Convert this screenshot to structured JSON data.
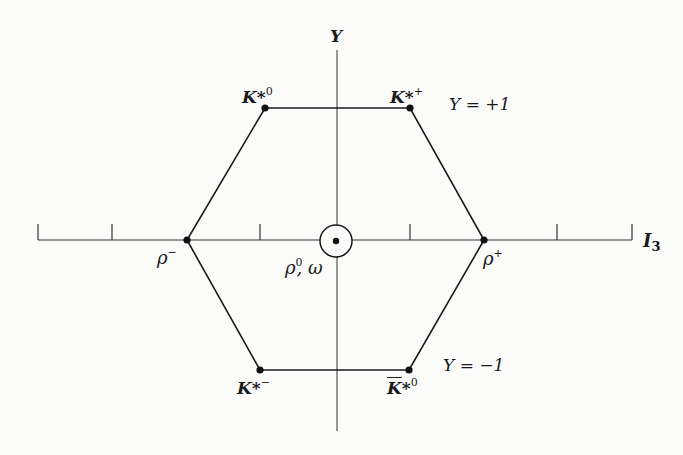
{
  "diagram": {
    "type": "weight-diagram",
    "axes": {
      "x": {
        "label": "I",
        "label_sub": "3",
        "ticks": 9
      },
      "y": {
        "label": "Y"
      }
    },
    "rows": [
      {
        "label": "Y = +1"
      },
      {
        "label": "Y = −1"
      }
    ],
    "particles": [
      {
        "id": "k-star-0",
        "base": "K",
        "star": "*",
        "sup": "0",
        "bar": false
      },
      {
        "id": "k-star-plus",
        "base": "K",
        "star": "*",
        "sup": "+",
        "bar": false
      },
      {
        "id": "rho-minus",
        "base": "ρ",
        "sup": "−"
      },
      {
        "id": "rho-plus",
        "base": "ρ",
        "sup": "+"
      },
      {
        "id": "rho-0-omega",
        "base": "ρ",
        "sup": "0",
        "suffix": ", ω"
      },
      {
        "id": "k-star-minus",
        "base": "K",
        "star": "*",
        "sup": "−",
        "bar": false
      },
      {
        "id": "k-bar-star-0",
        "base": "K",
        "star": "*",
        "sup": "0",
        "bar": true
      }
    ]
  }
}
